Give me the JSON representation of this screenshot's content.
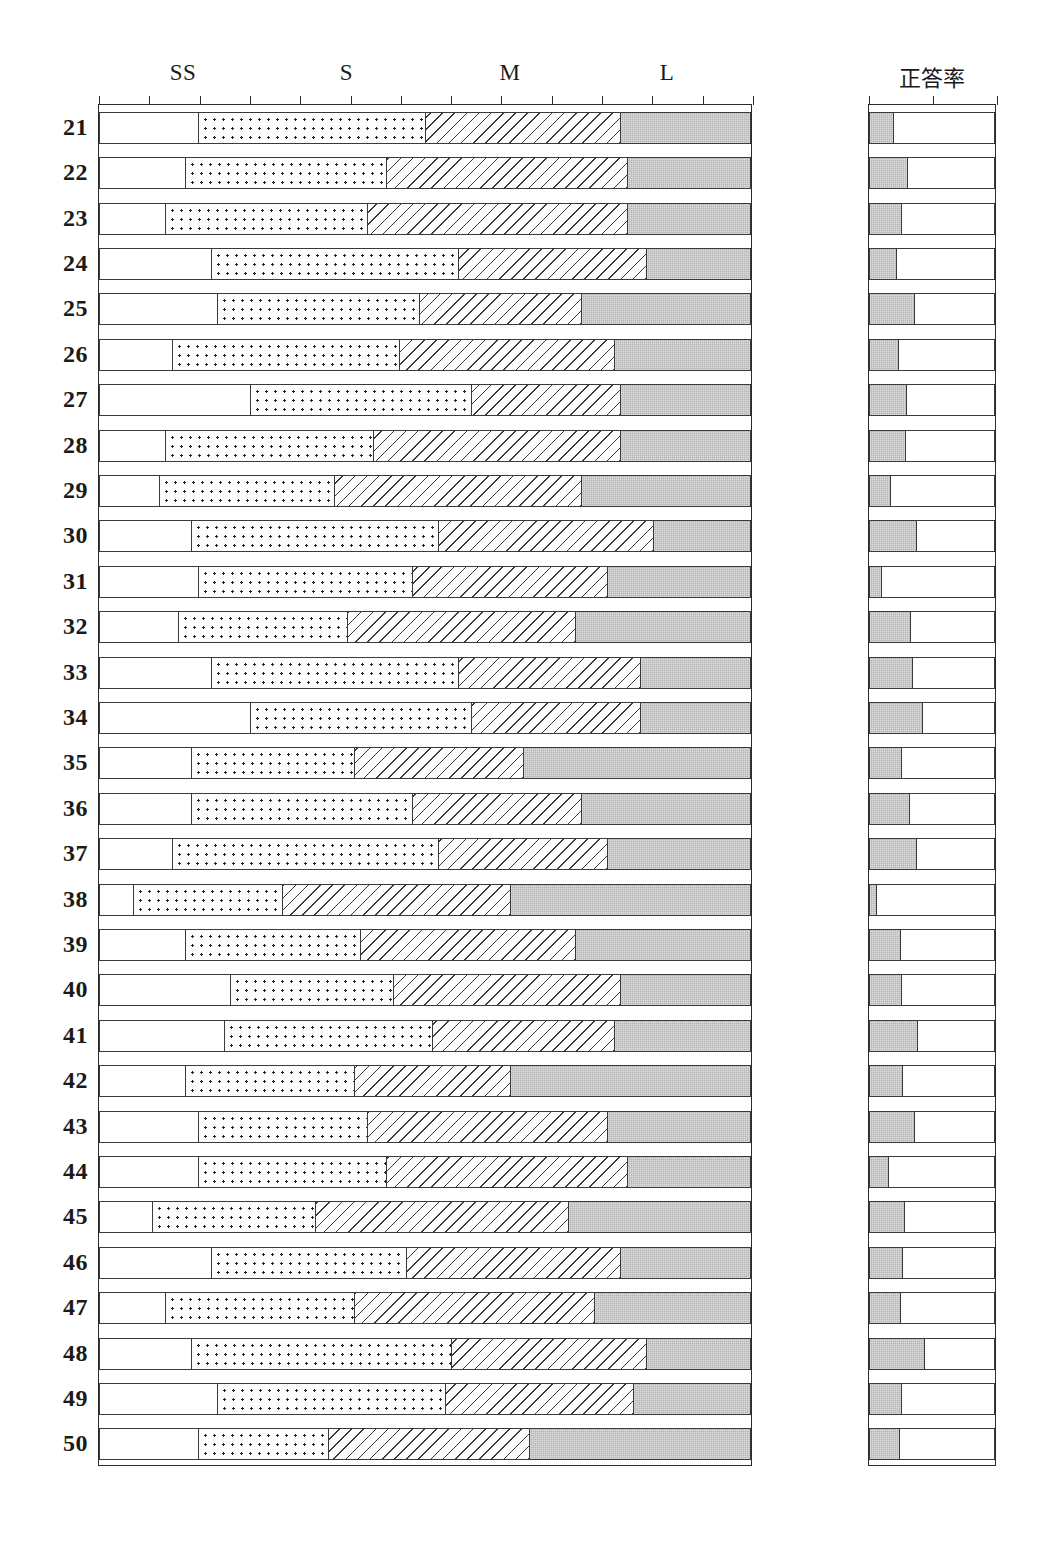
{
  "headers": {
    "left_columns": [
      {
        "label": "SS",
        "x_pct": 13.0
      },
      {
        "label": "S",
        "x_pct": 38.0
      },
      {
        "label": "M",
        "x_pct": 63.0
      },
      {
        "label": "L",
        "x_pct": 87.0
      }
    ],
    "rate_label": "正答率"
  },
  "colors": {
    "gray_fill": "#b5b5b5",
    "line": "#3a3a3a",
    "background": "#ffffff"
  },
  "chart_data": {
    "type": "bar",
    "title": "",
    "subtitle": "",
    "xlabel": "",
    "ylabel": "",
    "orientation": "horizontal",
    "stacked": true,
    "grid": false,
    "legend_position": "top",
    "xlim": [
      0,
      100
    ],
    "left_axis_ticks": 13,
    "rate_axis_ticks": 3,
    "series": [
      {
        "name": "SS",
        "pattern": "blank"
      },
      {
        "name": "S",
        "pattern": "dotted"
      },
      {
        "name": "M",
        "pattern": "hatched"
      },
      {
        "name": "L",
        "pattern": "solid-gray"
      }
    ],
    "categories": [
      "21",
      "22",
      "23",
      "24",
      "25",
      "26",
      "27",
      "28",
      "29",
      "30",
      "31",
      "32",
      "33",
      "34",
      "35",
      "36",
      "37",
      "38",
      "39",
      "40",
      "41",
      "42",
      "43",
      "44",
      "45",
      "46",
      "47",
      "48",
      "49",
      "50"
    ],
    "rows": [
      {
        "label": "21",
        "SS": 15.0,
        "S": 35.0,
        "M": 30.0,
        "L": 20.0,
        "rate": 19.0
      },
      {
        "label": "22",
        "SS": 13.0,
        "S": 31.0,
        "M": 37.0,
        "L": 19.0,
        "rate": 31.0
      },
      {
        "label": "23",
        "SS": 10.0,
        "S": 31.0,
        "M": 40.0,
        "L": 19.0,
        "rate": 26.0
      },
      {
        "label": "24",
        "SS": 17.0,
        "S": 38.0,
        "M": 29.0,
        "L": 16.0,
        "rate": 22.0
      },
      {
        "label": "25",
        "SS": 18.0,
        "S": 31.0,
        "M": 25.0,
        "L": 26.0,
        "rate": 36.0
      },
      {
        "label": "26",
        "SS": 11.0,
        "S": 35.0,
        "M": 33.0,
        "L": 21.0,
        "rate": 23.0
      },
      {
        "label": "27",
        "SS": 23.0,
        "S": 34.0,
        "M": 23.0,
        "L": 20.0,
        "rate": 30.0
      },
      {
        "label": "28",
        "SS": 10.0,
        "S": 32.0,
        "M": 38.0,
        "L": 20.0,
        "rate": 29.0
      },
      {
        "label": "29",
        "SS": 9.0,
        "S": 27.0,
        "M": 38.0,
        "L": 26.0,
        "rate": 17.0
      },
      {
        "label": "30",
        "SS": 14.0,
        "S": 38.0,
        "M": 33.0,
        "L": 15.0,
        "rate": 38.0
      },
      {
        "label": "31",
        "SS": 15.0,
        "S": 33.0,
        "M": 30.0,
        "L": 22.0,
        "rate": 10.0
      },
      {
        "label": "32",
        "SS": 12.0,
        "S": 26.0,
        "M": 35.0,
        "L": 27.0,
        "rate": 33.0
      },
      {
        "label": "33",
        "SS": 17.0,
        "S": 38.0,
        "M": 28.0,
        "L": 17.0,
        "rate": 35.0
      },
      {
        "label": "34",
        "SS": 23.0,
        "S": 34.0,
        "M": 26.0,
        "L": 17.0,
        "rate": 43.0
      },
      {
        "label": "35",
        "SS": 14.0,
        "S": 25.0,
        "M": 26.0,
        "L": 35.0,
        "rate": 26.0
      },
      {
        "label": "36",
        "SS": 14.0,
        "S": 34.0,
        "M": 26.0,
        "L": 26.0,
        "rate": 32.0
      },
      {
        "label": "37",
        "SS": 11.0,
        "S": 41.0,
        "M": 26.0,
        "L": 22.0,
        "rate": 38.0
      },
      {
        "label": "38",
        "SS": 5.0,
        "S": 23.0,
        "M": 35.0,
        "L": 37.0,
        "rate": 6.0
      },
      {
        "label": "39",
        "SS": 13.0,
        "S": 27.0,
        "M": 33.0,
        "L": 27.0,
        "rate": 25.0
      },
      {
        "label": "40",
        "SS": 20.0,
        "S": 25.0,
        "M": 35.0,
        "L": 20.0,
        "rate": 26.0
      },
      {
        "label": "41",
        "SS": 19.0,
        "S": 32.0,
        "M": 28.0,
        "L": 21.0,
        "rate": 39.0
      },
      {
        "label": "42",
        "SS": 13.0,
        "S": 26.0,
        "M": 24.0,
        "L": 37.0,
        "rate": 27.0
      },
      {
        "label": "43",
        "SS": 15.0,
        "S": 26.0,
        "M": 37.0,
        "L": 22.0,
        "rate": 36.0
      },
      {
        "label": "44",
        "SS": 15.0,
        "S": 29.0,
        "M": 37.0,
        "L": 19.0,
        "rate": 15.0
      },
      {
        "label": "45",
        "SS": 8.0,
        "S": 25.0,
        "M": 39.0,
        "L": 28.0,
        "rate": 28.0
      },
      {
        "label": "46",
        "SS": 17.0,
        "S": 30.0,
        "M": 33.0,
        "L": 20.0,
        "rate": 27.0
      },
      {
        "label": "47",
        "SS": 10.0,
        "S": 29.0,
        "M": 37.0,
        "L": 24.0,
        "rate": 25.0
      },
      {
        "label": "48",
        "SS": 14.0,
        "S": 40.0,
        "M": 30.0,
        "L": 16.0,
        "rate": 44.0
      },
      {
        "label": "49",
        "SS": 18.0,
        "S": 35.0,
        "M": 29.0,
        "L": 18.0,
        "rate": 26.0
      },
      {
        "label": "50",
        "SS": 15.0,
        "S": 20.0,
        "M": 31.0,
        "L": 34.0,
        "rate": 24.0
      }
    ]
  }
}
